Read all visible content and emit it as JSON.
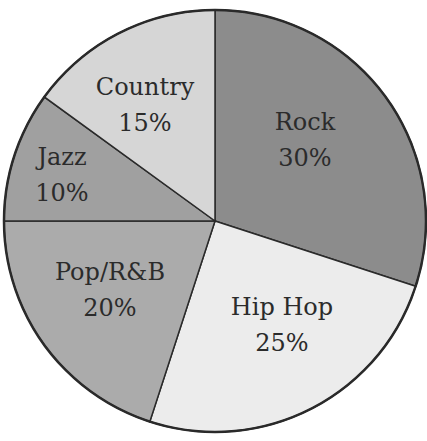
{
  "chart_data": {
    "type": "pie",
    "title": "",
    "categories": [
      "Rock",
      "Hip Hop",
      "Pop/R&B",
      "Jazz",
      "Country"
    ],
    "values": [
      30,
      25,
      20,
      10,
      15
    ],
    "labels": [
      "30%",
      "25%",
      "20%",
      "10%",
      "15%"
    ],
    "colors": [
      "#8c8c8c",
      "#ececec",
      "#ababab",
      "#a0a0a0",
      "#d6d6d6"
    ],
    "start_angle_deg": -90,
    "direction": "clockwise",
    "legend": "none",
    "label_position": "inside",
    "center": [
      215,
      221
    ],
    "radius": 211,
    "label_offsets": [
      {
        "x": 305,
        "y": 130
      },
      {
        "x": 282,
        "y": 315
      },
      {
        "x": 110,
        "y": 280
      },
      {
        "x": 62,
        "y": 165
      },
      {
        "x": 145,
        "y": 95
      }
    ]
  }
}
